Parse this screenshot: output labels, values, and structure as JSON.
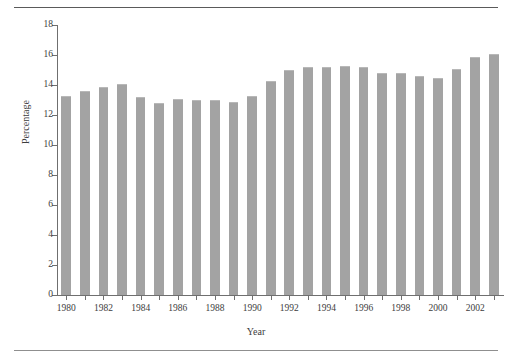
{
  "chart_data": {
    "type": "bar",
    "title": "",
    "xlabel": "Year",
    "ylabel": "Percentage",
    "categories": [
      "1980",
      "1981",
      "1982",
      "1983",
      "1984",
      "1985",
      "1986",
      "1987",
      "1988",
      "1989",
      "1990",
      "1991",
      "1992",
      "1993",
      "1994",
      "1995",
      "1996",
      "1997",
      "1998",
      "1999",
      "2000",
      "2001",
      "2002",
      "2003"
    ],
    "values": [
      13.3,
      13.6,
      13.9,
      14.1,
      13.2,
      12.8,
      13.1,
      13.0,
      13.0,
      12.9,
      13.3,
      14.3,
      15.0,
      15.2,
      15.2,
      15.3,
      15.2,
      14.8,
      14.8,
      14.6,
      14.5,
      15.1,
      15.9,
      16.1
    ],
    "ylim": [
      0,
      18
    ],
    "ytick_values": [
      0,
      2,
      4,
      6,
      8,
      10,
      12,
      14,
      16,
      18
    ],
    "ytick_labels": [
      "0",
      "2",
      "4",
      "6",
      "8",
      "10",
      "12",
      "14",
      "16",
      "18"
    ],
    "xtick_labels": [
      "1980",
      "1982",
      "1984",
      "1986",
      "1988",
      "1990",
      "1992",
      "1994",
      "1996",
      "1998",
      "2000",
      "2002"
    ],
    "xtick_categories": [
      "1980",
      "1982",
      "1984",
      "1986",
      "1988",
      "1990",
      "1992",
      "1994",
      "1996",
      "1998",
      "2000",
      "2002"
    ],
    "grid": false,
    "legend": "none",
    "bar_color": "#a3a3a3",
    "axis_color": "#6f6f6f"
  }
}
